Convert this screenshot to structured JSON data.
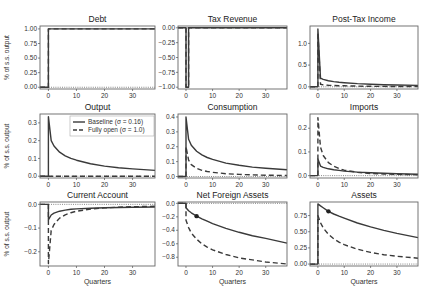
{
  "figure": {
    "ylabel": "% of s.s. output",
    "xlabel": "Quarters",
    "colors": {
      "line": "#3a3a3a",
      "axis": "#555555",
      "zero": "#555555",
      "frame": "#666666"
    }
  },
  "legend": {
    "panel": "Output",
    "entries": [
      {
        "label": "Baseline (σ = 0.16)",
        "style": "solid"
      },
      {
        "label": "Fully open (σ = 1.0)",
        "style": "dashed"
      }
    ]
  },
  "chart_data": [
    {
      "type": "line",
      "title": "Debt",
      "xlabel": "",
      "ylabel": "% of s.s. output",
      "xlim": [
        -3,
        38
      ],
      "ylim": [
        -0.03,
        1.05
      ],
      "xticks": [
        0,
        10,
        20,
        30
      ],
      "yticks": [
        0.0,
        0.25,
        0.5,
        0.75,
        1.0
      ],
      "ytick_labels": [
        "0.00",
        "0.25",
        "0.50",
        "0.75",
        "1.00"
      ],
      "series": [
        {
          "name": "Baseline (σ = 0.16)",
          "style": "solid",
          "x": [
            -3,
            0,
            0,
            38
          ],
          "y": [
            0,
            0,
            1.0,
            1.0
          ]
        },
        {
          "name": "Fully open (σ = 1.0)",
          "style": "dashed",
          "x": [
            -3,
            0,
            0,
            38
          ],
          "y": [
            0,
            0,
            1.0,
            1.0
          ]
        }
      ]
    },
    {
      "type": "line",
      "title": "Tax Revenue",
      "xlabel": "",
      "ylabel": "",
      "xlim": [
        -3,
        38
      ],
      "ylim": [
        -1.03,
        0.03
      ],
      "xticks": [
        0,
        10,
        20,
        30
      ],
      "yticks": [
        0.0,
        -0.25,
        -0.5,
        -0.75,
        -1.0
      ],
      "ytick_labels": [
        "0.00",
        "−0.25",
        "−0.50",
        "−0.75",
        "−1.00"
      ],
      "series": [
        {
          "name": "Baseline (σ = 0.16)",
          "style": "solid",
          "x": [
            -3,
            0,
            0,
            1,
            1,
            38
          ],
          "y": [
            0,
            0,
            -1.0,
            -1.0,
            0,
            0
          ]
        },
        {
          "name": "Fully open (σ = 1.0)",
          "style": "dashed",
          "x": [
            -3,
            0,
            0,
            1,
            1,
            38
          ],
          "y": [
            0,
            0,
            -1.0,
            -1.0,
            0,
            0
          ]
        }
      ]
    },
    {
      "type": "line",
      "title": "Post-Tax Income",
      "xlabel": "",
      "ylabel": "",
      "xlim": [
        -3,
        38
      ],
      "ylim": [
        -0.05,
        1.4
      ],
      "xticks": [
        0,
        10,
        20,
        30
      ],
      "yticks": [
        0.0,
        0.5,
        1.0
      ],
      "ytick_labels": [
        "0.0",
        "0.5",
        "1.0"
      ],
      "series": [
        {
          "name": "Baseline (σ = 0.16)",
          "style": "solid",
          "x": [
            -3,
            0,
            0,
            1,
            2,
            4,
            6,
            8,
            10,
            15,
            20,
            25,
            30,
            38
          ],
          "y": [
            0,
            0,
            1.33,
            0.2,
            0.17,
            0.14,
            0.12,
            0.105,
            0.095,
            0.075,
            0.06,
            0.05,
            0.042,
            0.032
          ]
        },
        {
          "name": "Fully open (σ = 1.0)",
          "style": "dashed",
          "x": [
            -3,
            0,
            0,
            1,
            2,
            4,
            6,
            8,
            10,
            15,
            20,
            25,
            30,
            38
          ],
          "y": [
            0,
            0,
            1.25,
            0.06,
            0.045,
            0.035,
            0.03,
            0.026,
            0.023,
            0.017,
            0.013,
            0.01,
            0.008,
            0.006
          ]
        }
      ]
    },
    {
      "type": "line",
      "title": "Output",
      "xlabel": "",
      "ylabel": "% of s.s. output",
      "xlim": [
        -3,
        38
      ],
      "ylim": [
        -0.01,
        0.35
      ],
      "xticks": [
        0,
        10,
        20,
        30
      ],
      "yticks": [
        0.0,
        0.1,
        0.2,
        0.3
      ],
      "ytick_labels": [
        "0.0",
        "0.1",
        "0.2",
        "0.3"
      ],
      "legend": true,
      "series": [
        {
          "name": "Baseline (σ = 0.16)",
          "style": "solid",
          "x": [
            -3,
            0,
            0,
            1,
            2,
            4,
            6,
            8,
            10,
            15,
            20,
            25,
            30,
            38
          ],
          "y": [
            0,
            0,
            0.335,
            0.2,
            0.17,
            0.135,
            0.115,
            0.1,
            0.09,
            0.07,
            0.057,
            0.048,
            0.041,
            0.033
          ]
        },
        {
          "name": "Fully open (σ = 1.0)",
          "style": "dashed",
          "x": [
            -3,
            0,
            38
          ],
          "y": [
            0,
            0,
            0
          ]
        }
      ]
    },
    {
      "type": "line",
      "title": "Consumption",
      "xlabel": "",
      "ylabel": "",
      "xlim": [
        -3,
        38
      ],
      "ylim": [
        -0.01,
        0.42
      ],
      "xticks": [
        0,
        10,
        20,
        30
      ],
      "yticks": [
        0.0,
        0.1,
        0.2,
        0.3,
        0.4
      ],
      "ytick_labels": [
        "0.0",
        "0.1",
        "0.2",
        "0.3",
        "0.4"
      ],
      "series": [
        {
          "name": "Baseline (σ = 0.16)",
          "style": "solid",
          "x": [
            -3,
            0,
            0,
            1,
            2,
            4,
            6,
            8,
            10,
            15,
            20,
            25,
            30,
            38
          ],
          "y": [
            0,
            0,
            0.4,
            0.25,
            0.21,
            0.17,
            0.145,
            0.128,
            0.115,
            0.09,
            0.075,
            0.063,
            0.055,
            0.045
          ]
        },
        {
          "name": "Fully open (σ = 1.0)",
          "style": "dashed",
          "x": [
            -3,
            0,
            0,
            1,
            2,
            4,
            6,
            8,
            10,
            15,
            20,
            25,
            30,
            38
          ],
          "y": [
            0,
            0,
            0.2,
            0.11,
            0.08,
            0.055,
            0.042,
            0.034,
            0.028,
            0.019,
            0.014,
            0.011,
            0.009,
            0.007
          ]
        }
      ]
    },
    {
      "type": "line",
      "title": "Imports",
      "xlabel": "",
      "ylabel": "",
      "xlim": [
        -3,
        38
      ],
      "ylim": [
        -0.01,
        0.26
      ],
      "xticks": [
        0,
        10,
        20,
        30
      ],
      "yticks": [
        0.0,
        0.1,
        0.2
      ],
      "ytick_labels": [
        "0.0",
        "0.1",
        "0.2"
      ],
      "series": [
        {
          "name": "Baseline (σ = 0.16)",
          "style": "solid",
          "x": [
            -3,
            0,
            0,
            1,
            2,
            4,
            6,
            8,
            10,
            15,
            20,
            25,
            30,
            38
          ],
          "y": [
            0,
            0,
            0.07,
            0.04,
            0.035,
            0.029,
            0.025,
            0.022,
            0.019,
            0.015,
            0.012,
            0.01,
            0.008,
            0.006
          ]
        },
        {
          "name": "Fully open (σ = 1.0)",
          "style": "dashed",
          "x": [
            -3,
            0,
            0,
            1,
            2,
            4,
            6,
            8,
            10,
            15,
            20,
            25,
            30,
            38
          ],
          "y": [
            0,
            0,
            0.245,
            0.12,
            0.085,
            0.055,
            0.04,
            0.03,
            0.023,
            0.014,
            0.009,
            0.007,
            0.005,
            0.004
          ]
        }
      ]
    },
    {
      "type": "line",
      "title": "Current Account",
      "xlabel": "Quarters",
      "ylabel": "% of s.s. output",
      "xlim": [
        -3,
        38
      ],
      "ylim": [
        -0.26,
        0.01
      ],
      "xticks": [
        0,
        10,
        20,
        30
      ],
      "yticks": [
        0.0,
        -0.1,
        -0.2
      ],
      "ytick_labels": [
        "0.0",
        "−0.1",
        "−0.2"
      ],
      "series": [
        {
          "name": "Baseline (σ = 0.16)",
          "style": "solid",
          "x": [
            -3,
            0,
            0,
            1,
            2,
            4,
            6,
            8,
            10,
            15,
            20,
            25,
            30,
            38
          ],
          "y": [
            0,
            0,
            -0.065,
            -0.045,
            -0.037,
            -0.029,
            -0.024,
            -0.021,
            -0.019,
            -0.016,
            -0.014,
            -0.013,
            -0.012,
            -0.011
          ]
        },
        {
          "name": "Fully open (σ = 1.0)",
          "style": "dashed",
          "x": [
            -3,
            0,
            0,
            1,
            2,
            4,
            6,
            8,
            10,
            15,
            20,
            25,
            30,
            38
          ],
          "y": [
            0,
            0,
            -0.25,
            -0.11,
            -0.085,
            -0.058,
            -0.044,
            -0.035,
            -0.029,
            -0.02,
            -0.015,
            -0.012,
            -0.01,
            -0.008
          ]
        }
      ]
    },
    {
      "type": "line",
      "title": "Net Foreign Assets",
      "xlabel": "Quarters",
      "ylabel": "",
      "xlim": [
        -3,
        38
      ],
      "ylim": [
        -0.93,
        0.02
      ],
      "xticks": [
        0,
        10,
        20,
        30
      ],
      "yticks": [
        0.0,
        -0.2,
        -0.4,
        -0.6,
        -0.8
      ],
      "ytick_labels": [
        "0.0",
        "−0.2",
        "−0.4",
        "−0.6",
        "−0.8"
      ],
      "marker": {
        "x": 4,
        "y": -0.19
      },
      "series": [
        {
          "name": "Baseline (σ = 0.16)",
          "style": "solid",
          "x": [
            -3,
            0,
            0,
            1,
            2,
            4,
            6,
            8,
            10,
            15,
            20,
            25,
            30,
            38
          ],
          "y": [
            0,
            0,
            -0.065,
            -0.11,
            -0.14,
            -0.19,
            -0.23,
            -0.265,
            -0.3,
            -0.37,
            -0.43,
            -0.48,
            -0.52,
            -0.59
          ]
        },
        {
          "name": "Fully open (σ = 1.0)",
          "style": "dashed",
          "x": [
            -3,
            0,
            0,
            1,
            2,
            4,
            6,
            8,
            10,
            15,
            20,
            25,
            30,
            38
          ],
          "y": [
            0,
            0,
            -0.25,
            -0.36,
            -0.44,
            -0.53,
            -0.6,
            -0.65,
            -0.69,
            -0.76,
            -0.81,
            -0.84,
            -0.87,
            -0.9
          ]
        }
      ]
    },
    {
      "type": "line",
      "title": "Assets",
      "xlabel": "Quarters",
      "ylabel": "",
      "xlim": [
        -3,
        38
      ],
      "ylim": [
        -0.03,
        0.96
      ],
      "xticks": [
        0,
        10,
        20,
        30
      ],
      "yticks": [
        0.0,
        0.25,
        0.5,
        0.75
      ],
      "ytick_labels": [
        "0.00",
        "0.25",
        "0.50",
        "0.75"
      ],
      "marker": {
        "x": 4,
        "y": 0.815
      },
      "series": [
        {
          "name": "Baseline (σ = 0.16)",
          "style": "solid",
          "x": [
            -3,
            0,
            0,
            1,
            2,
            4,
            6,
            8,
            10,
            15,
            20,
            25,
            30,
            38
          ],
          "y": [
            0,
            0,
            0.93,
            0.9,
            0.87,
            0.815,
            0.775,
            0.74,
            0.71,
            0.635,
            0.575,
            0.52,
            0.475,
            0.41
          ]
        },
        {
          "name": "Fully open (σ = 1.0)",
          "style": "dashed",
          "x": [
            -3,
            0,
            0,
            1,
            2,
            4,
            6,
            8,
            10,
            15,
            20,
            25,
            30,
            38
          ],
          "y": [
            0,
            0,
            0.75,
            0.64,
            0.56,
            0.46,
            0.39,
            0.34,
            0.3,
            0.23,
            0.18,
            0.145,
            0.12,
            0.09
          ]
        }
      ]
    }
  ]
}
